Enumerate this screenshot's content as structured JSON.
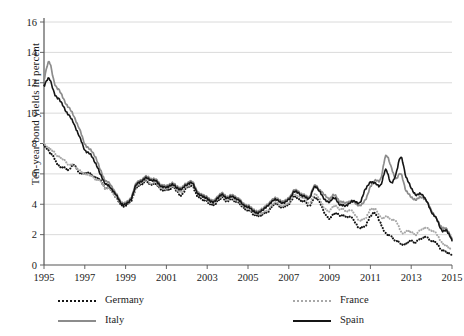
{
  "chart_data": {
    "type": "line",
    "title": "",
    "xlabel": "",
    "ylabel": "Ten-year bond yields in percent",
    "xlim": [
      1995,
      2015
    ],
    "ylim": [
      0,
      16
    ],
    "ytick_step": 2,
    "yticks": [
      "0",
      "2",
      "4",
      "6",
      "8",
      "10",
      "12",
      "14",
      "16"
    ],
    "xticks": [
      "1995",
      "1997",
      "1999",
      "2001",
      "2003",
      "2005",
      "2007",
      "2009",
      "2011",
      "2013",
      "2015"
    ],
    "grid": "horizontal",
    "legend_position": "below-plot-two-columns",
    "series": [
      {
        "name": "Germany",
        "style": "dotted",
        "color": "#151515",
        "x": [
          1995.0,
          1995.25,
          1995.5,
          1995.75,
          1996.0,
          1996.25,
          1996.5,
          1996.75,
          1997.0,
          1997.25,
          1997.5,
          1997.75,
          1998.0,
          1998.25,
          1998.5,
          1998.75,
          1999.0,
          1999.25,
          1999.5,
          1999.75,
          2000.0,
          2000.25,
          2000.5,
          2000.75,
          2001.0,
          2001.25,
          2001.5,
          2001.75,
          2002.0,
          2002.25,
          2002.5,
          2002.75,
          2003.0,
          2003.25,
          2003.5,
          2003.75,
          2004.0,
          2004.25,
          2004.5,
          2004.75,
          2005.0,
          2005.25,
          2005.5,
          2005.75,
          2006.0,
          2006.25,
          2006.5,
          2006.75,
          2007.0,
          2007.25,
          2007.5,
          2007.75,
          2008.0,
          2008.25,
          2008.5,
          2008.75,
          2009.0,
          2009.25,
          2009.5,
          2009.75,
          2010.0,
          2010.25,
          2010.5,
          2010.75,
          2011.0,
          2011.25,
          2011.5,
          2011.75,
          2012.0,
          2012.25,
          2012.5,
          2012.75,
          2013.0,
          2013.25,
          2013.5,
          2013.75,
          2014.0,
          2014.25,
          2014.5,
          2014.75,
          2015.0
        ],
        "values": [
          7.9,
          7.5,
          7.0,
          6.5,
          6.4,
          6.3,
          6.6,
          6.0,
          6.1,
          6.0,
          5.8,
          5.6,
          5.1,
          5.0,
          4.5,
          4.0,
          3.9,
          4.2,
          5.0,
          5.3,
          5.5,
          5.3,
          5.3,
          5.0,
          4.9,
          5.1,
          4.9,
          4.6,
          5.1,
          5.2,
          4.6,
          4.3,
          4.2,
          3.9,
          4.2,
          4.4,
          4.2,
          4.3,
          4.1,
          3.8,
          3.6,
          3.4,
          3.2,
          3.4,
          3.5,
          4.0,
          3.9,
          3.8,
          4.0,
          4.5,
          4.3,
          4.2,
          3.9,
          4.4,
          4.2,
          3.4,
          3.1,
          3.4,
          3.3,
          3.2,
          3.2,
          2.8,
          2.4,
          2.6,
          3.2,
          3.4,
          2.7,
          2.1,
          1.9,
          1.6,
          1.4,
          1.4,
          1.6,
          1.5,
          1.8,
          1.8,
          1.6,
          1.4,
          1.0,
          0.8,
          0.6
        ]
      },
      {
        "name": "France",
        "style": "dotted",
        "color": "#a8a8a8",
        "x": [
          1995.0,
          1995.25,
          1995.5,
          1995.75,
          1996.0,
          1996.25,
          1996.5,
          1996.75,
          1997.0,
          1997.25,
          1997.5,
          1997.75,
          1998.0,
          1998.25,
          1998.5,
          1998.75,
          1999.0,
          1999.25,
          1999.5,
          1999.75,
          2000.0,
          2000.25,
          2000.5,
          2000.75,
          2001.0,
          2001.25,
          2001.5,
          2001.75,
          2002.0,
          2002.25,
          2002.5,
          2002.75,
          2003.0,
          2003.25,
          2003.5,
          2003.75,
          2004.0,
          2004.25,
          2004.5,
          2004.75,
          2005.0,
          2005.25,
          2005.5,
          2005.75,
          2006.0,
          2006.25,
          2006.5,
          2006.75,
          2007.0,
          2007.25,
          2007.5,
          2007.75,
          2008.0,
          2008.25,
          2008.5,
          2008.75,
          2009.0,
          2009.25,
          2009.5,
          2009.75,
          2010.0,
          2010.25,
          2010.5,
          2010.75,
          2011.0,
          2011.25,
          2011.5,
          2011.75,
          2012.0,
          2012.25,
          2012.5,
          2012.75,
          2013.0,
          2013.25,
          2013.5,
          2013.75,
          2014.0,
          2014.25,
          2014.5,
          2014.75,
          2015.0
        ],
        "values": [
          8.0,
          7.7,
          7.4,
          7.1,
          6.9,
          6.6,
          6.5,
          6.2,
          6.0,
          5.9,
          5.7,
          5.5,
          5.1,
          5.0,
          4.5,
          4.1,
          4.0,
          4.3,
          5.1,
          5.4,
          5.6,
          5.4,
          5.4,
          5.1,
          5.0,
          5.2,
          5.0,
          4.8,
          5.2,
          5.3,
          4.8,
          4.5,
          4.3,
          4.0,
          4.3,
          4.5,
          4.3,
          4.4,
          4.2,
          3.9,
          3.7,
          3.5,
          3.3,
          3.5,
          3.6,
          4.1,
          4.0,
          3.9,
          4.1,
          4.6,
          4.5,
          4.4,
          4.1,
          4.6,
          4.4,
          3.7,
          3.6,
          3.9,
          3.7,
          3.6,
          3.6,
          3.3,
          2.9,
          3.1,
          3.6,
          3.7,
          3.1,
          3.2,
          3.0,
          2.9,
          2.2,
          2.2,
          2.2,
          2.0,
          2.4,
          2.4,
          2.3,
          2.0,
          1.5,
          1.2,
          1.0
        ]
      },
      {
        "name": "Italy",
        "style": "solid",
        "color": "#8c8c8c",
        "x": [
          1995.0,
          1995.25,
          1995.5,
          1995.75,
          1996.0,
          1996.25,
          1996.5,
          1996.75,
          1997.0,
          1997.25,
          1997.5,
          1997.75,
          1998.0,
          1998.25,
          1998.5,
          1998.75,
          1999.0,
          1999.25,
          1999.5,
          1999.75,
          2000.0,
          2000.25,
          2000.5,
          2000.75,
          2001.0,
          2001.25,
          2001.5,
          2001.75,
          2002.0,
          2002.25,
          2002.5,
          2002.75,
          2003.0,
          2003.25,
          2003.5,
          2003.75,
          2004.0,
          2004.25,
          2004.5,
          2004.75,
          2005.0,
          2005.25,
          2005.5,
          2005.75,
          2006.0,
          2006.25,
          2006.5,
          2006.75,
          2007.0,
          2007.25,
          2007.5,
          2007.75,
          2008.0,
          2008.25,
          2008.5,
          2008.75,
          2009.0,
          2009.25,
          2009.5,
          2009.75,
          2010.0,
          2010.25,
          2010.5,
          2010.75,
          2011.0,
          2011.25,
          2011.5,
          2011.75,
          2012.0,
          2012.25,
          2012.5,
          2012.75,
          2013.0,
          2013.25,
          2013.5,
          2013.75,
          2014.0,
          2014.25,
          2014.5,
          2014.75,
          2015.0
        ],
        "values": [
          12.2,
          13.4,
          12.0,
          11.5,
          10.8,
          10.3,
          9.7,
          8.9,
          8.0,
          7.6,
          7.2,
          6.3,
          5.6,
          5.3,
          4.8,
          4.2,
          4.1,
          4.4,
          5.3,
          5.6,
          5.8,
          5.7,
          5.6,
          5.3,
          5.2,
          5.4,
          5.2,
          5.1,
          5.4,
          5.5,
          4.9,
          4.6,
          4.5,
          4.2,
          4.5,
          4.7,
          4.5,
          4.6,
          4.4,
          4.1,
          3.9,
          3.7,
          3.5,
          3.8,
          4.0,
          4.4,
          4.3,
          4.2,
          4.4,
          4.9,
          4.8,
          4.6,
          4.5,
          5.2,
          5.0,
          4.6,
          4.4,
          4.6,
          4.2,
          4.1,
          4.2,
          4.1,
          3.9,
          4.3,
          5.1,
          5.6,
          5.6,
          7.2,
          6.5,
          5.7,
          6.0,
          4.9,
          4.5,
          4.3,
          4.5,
          4.2,
          3.6,
          3.0,
          2.5,
          2.3,
          1.7
        ]
      },
      {
        "name": "Spain",
        "style": "solid",
        "color": "#151515",
        "x": [
          1995.0,
          1995.25,
          1995.5,
          1995.75,
          1996.0,
          1996.25,
          1996.5,
          1996.75,
          1997.0,
          1997.25,
          1997.5,
          1997.75,
          1998.0,
          1998.25,
          1998.5,
          1998.75,
          1999.0,
          1999.25,
          1999.5,
          1999.75,
          2000.0,
          2000.25,
          2000.5,
          2000.75,
          2001.0,
          2001.25,
          2001.5,
          2001.75,
          2002.0,
          2002.25,
          2002.5,
          2002.75,
          2003.0,
          2003.25,
          2003.5,
          2003.75,
          2004.0,
          2004.25,
          2004.5,
          2004.75,
          2005.0,
          2005.25,
          2005.5,
          2005.75,
          2006.0,
          2006.25,
          2006.5,
          2006.75,
          2007.0,
          2007.25,
          2007.5,
          2007.75,
          2008.0,
          2008.25,
          2008.5,
          2008.75,
          2009.0,
          2009.25,
          2009.5,
          2009.75,
          2010.0,
          2010.25,
          2010.5,
          2010.75,
          2011.0,
          2011.25,
          2011.5,
          2011.75,
          2012.0,
          2012.25,
          2012.5,
          2012.75,
          2013.0,
          2013.25,
          2013.5,
          2013.75,
          2014.0,
          2014.25,
          2014.5,
          2014.75,
          2015.0
        ],
        "values": [
          11.8,
          12.3,
          11.3,
          10.9,
          10.3,
          9.8,
          9.2,
          8.4,
          7.6,
          7.3,
          6.8,
          6.0,
          5.4,
          5.1,
          4.7,
          4.1,
          4.0,
          4.3,
          5.2,
          5.5,
          5.7,
          5.6,
          5.5,
          5.2,
          5.1,
          5.3,
          5.1,
          5.0,
          5.3,
          5.4,
          4.8,
          4.5,
          4.4,
          4.1,
          4.4,
          4.6,
          4.4,
          4.5,
          4.3,
          4.0,
          3.8,
          3.6,
          3.4,
          3.7,
          3.9,
          4.3,
          4.2,
          4.1,
          4.3,
          4.8,
          4.7,
          4.5,
          4.4,
          5.1,
          4.9,
          4.3,
          4.2,
          4.4,
          4.0,
          3.9,
          4.1,
          4.2,
          4.1,
          5.0,
          5.4,
          5.4,
          5.2,
          6.3,
          5.4,
          6.0,
          7.1,
          5.8,
          5.1,
          4.6,
          4.7,
          4.2,
          3.5,
          3.0,
          2.3,
          2.2,
          1.6
        ]
      }
    ]
  },
  "axis": {
    "y_title": "Ten-year bond yields in percent"
  },
  "legend": {
    "germany": "Germany",
    "france": "France",
    "italy": "Italy",
    "spain": "Spain"
  }
}
